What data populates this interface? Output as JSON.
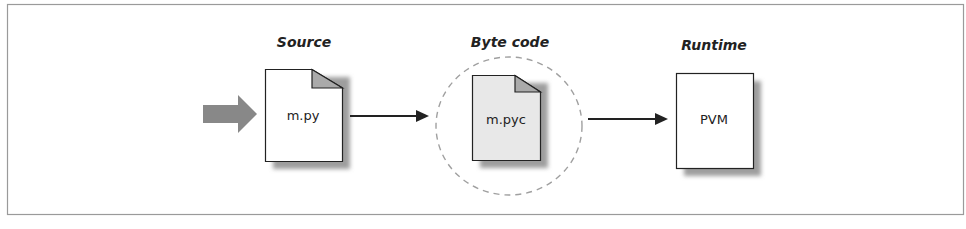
{
  "diagram": {
    "stages": [
      {
        "heading": "Source",
        "file": "m.py",
        "shape": "document",
        "fill": "#ffffff"
      },
      {
        "heading": "Byte code",
        "file": "m.pyc",
        "shape": "document-in-dashed-circle",
        "fill": "#e8e8e8"
      },
      {
        "heading": "Runtime",
        "file": "PVM",
        "shape": "box",
        "fill": "#ffffff"
      }
    ],
    "input_arrow": {
      "type": "block-arrow",
      "color": "#888888"
    },
    "connectors": [
      {
        "from": "m.py",
        "to": "m.pyc"
      },
      {
        "from": "m.pyc",
        "to": "PVM"
      }
    ],
    "colors": {
      "frame": "#9a9a9a",
      "stroke": "#222222",
      "fold": "#aaaaaa",
      "shadow": "#9e9e9e",
      "dashed_circle": "#a0a0a0"
    }
  }
}
